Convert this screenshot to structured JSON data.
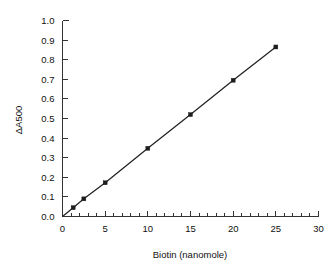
{
  "chart_data": {
    "type": "line",
    "title": "",
    "subtitle": "",
    "xlabel": "Biotin (nanomole)",
    "ylabel": "ΔA500",
    "xlim": [
      0,
      30
    ],
    "ylim": [
      0.0,
      1.0
    ],
    "grid": false,
    "legend": false,
    "legend_position": "none",
    "marker": "filled-square",
    "x": [
      0,
      1.25,
      2.5,
      5,
      10,
      15,
      20,
      25
    ],
    "y": [
      0.0,
      0.045,
      0.09,
      0.172,
      0.348,
      0.52,
      0.695,
      0.865
    ],
    "series": [
      {
        "name": "Biotin standard curve",
        "x": [
          0,
          1.25,
          2.5,
          5,
          10,
          15,
          20,
          25
        ],
        "values": [
          0.0,
          0.045,
          0.09,
          0.172,
          0.348,
          0.52,
          0.695,
          0.865
        ]
      }
    ],
    "xticks": [
      0,
      5,
      10,
      15,
      20,
      25,
      30
    ],
    "xtick_labels": [
      "0",
      "5",
      "10",
      "15",
      "20",
      "25",
      "30"
    ],
    "x_minor_tick_interval": 1,
    "yticks": [
      0.0,
      0.1,
      0.2,
      0.3,
      0.4,
      0.5,
      0.6,
      0.7,
      0.8,
      0.9,
      1.0
    ],
    "ytick_labels": [
      "0.0",
      "0.1",
      "0.2",
      "0.3",
      "0.4",
      "0.5",
      "0.6",
      "0.7",
      "0.8",
      "0.9",
      "1.0"
    ],
    "annotations": [],
    "colors": {
      "line": "#222222",
      "marker": "#1d1d1d",
      "axis": "#333333",
      "text": "#111111",
      "background": "#ffffff"
    }
  },
  "axes": {
    "x_title": "Biotin (nanomole)",
    "y_title": "ΔA500",
    "x_labels": [
      "0",
      "5",
      "10",
      "15",
      "20",
      "25",
      "30"
    ],
    "y_labels": [
      "0.0",
      "0.1",
      "0.2",
      "0.3",
      "0.4",
      "0.5",
      "0.6",
      "0.7",
      "0.8",
      "0.9",
      "1.0"
    ]
  }
}
